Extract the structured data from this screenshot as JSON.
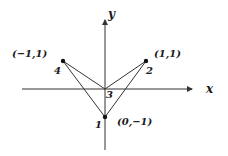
{
  "diagram": {
    "axes": {
      "x_label": "x",
      "y_label": "y"
    },
    "points": [
      {
        "id": "1",
        "label": "1",
        "coord_label": "(0,−1)",
        "x": 0,
        "y": -1
      },
      {
        "id": "2",
        "label": "2",
        "coord_label": "(1,1)",
        "x": 1,
        "y": 1
      },
      {
        "id": "3",
        "label": "3",
        "coord_label": "",
        "x": 0,
        "y": 0
      },
      {
        "id": "4",
        "label": "4",
        "coord_label": "(−1,1)",
        "x": -1,
        "y": 1
      }
    ],
    "segments": [
      [
        "4",
        "3"
      ],
      [
        "4",
        "1"
      ],
      [
        "2",
        "3"
      ],
      [
        "2",
        "1"
      ]
    ]
  }
}
